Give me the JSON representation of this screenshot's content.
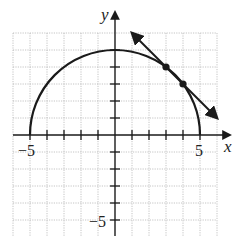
{
  "diagram": {
    "type": "function-graph",
    "axes": {
      "x_label": "x",
      "y_label": "y",
      "x_ticks": [
        -5,
        5
      ],
      "y_ticks": [
        -5
      ],
      "x_tick_labels": [
        "−5",
        "5"
      ],
      "y_tick_labels": [
        "−5"
      ],
      "grid_range": {
        "x": [
          -6,
          6
        ],
        "y": [
          -6,
          6
        ]
      }
    },
    "curve": {
      "equation": "y = sqrt(25 - x^2)",
      "x_range": [
        -5,
        5
      ],
      "radius": 5
    },
    "line": {
      "equation": "y = -x + 7",
      "from": [
        1,
        6
      ],
      "to": [
        6,
        1
      ],
      "arrows": "both"
    },
    "points": [
      [
        3,
        4
      ],
      [
        4,
        3
      ]
    ],
    "colors": {
      "ink": "#1a1a1a",
      "grid": "#b5b5b5",
      "background": "#ffffff"
    }
  }
}
